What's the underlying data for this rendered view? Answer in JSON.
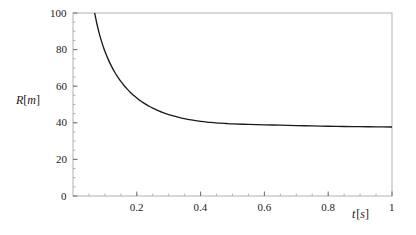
{
  "chart_data": {
    "type": "line",
    "title": "",
    "subtitle": "",
    "xlabel": "t [s]",
    "ylabel": "R[m]",
    "xlabel_parts": {
      "symbol": "t",
      "open": "[",
      "unit": "s",
      "close": "]"
    },
    "ylabel_parts": {
      "symbol": "R",
      "open": "[",
      "unit": "m",
      "close": "]"
    },
    "xlim": [
      0,
      1
    ],
    "ylim": [
      0,
      100
    ],
    "xticks": [
      0.2,
      0.4,
      0.6,
      0.8,
      1
    ],
    "xtick_labels": [
      "0.2",
      "0.4",
      "0.6",
      "0.8",
      "1"
    ],
    "yticks": [
      0,
      20,
      40,
      60,
      80,
      100
    ],
    "ytick_labels": [
      "0",
      "20",
      "40",
      "60",
      "80",
      "100"
    ],
    "x_minor_step": 0.05,
    "y_minor_step": 5,
    "grid": false,
    "legend": null,
    "legend_position": "none",
    "frame": true,
    "series": [
      {
        "name": "R(t)",
        "color": "#1a1a1a",
        "x": [
          0.068,
          0.072,
          0.076,
          0.08,
          0.085,
          0.09,
          0.095,
          0.1,
          0.11,
          0.12,
          0.13,
          0.14,
          0.15,
          0.16,
          0.17,
          0.18,
          0.19,
          0.2,
          0.21,
          0.22,
          0.23,
          0.24,
          0.25,
          0.26,
          0.27,
          0.28,
          0.3,
          0.32,
          0.34,
          0.36,
          0.38,
          0.4,
          0.42,
          0.44,
          0.46,
          0.48,
          0.5,
          0.55,
          0.6,
          0.65,
          0.7,
          0.75,
          0.8,
          0.85,
          0.9,
          0.95,
          1.0
        ],
        "y": [
          100.0,
          96.5,
          93.3,
          90.4,
          87.1,
          84.2,
          81.5,
          79.1,
          74.8,
          71.1,
          67.9,
          65.1,
          62.6,
          60.4,
          58.4,
          56.6,
          55.0,
          53.5,
          52.2,
          51.0,
          49.9,
          48.9,
          48.0,
          47.2,
          46.4,
          45.7,
          44.5,
          43.5,
          42.6,
          41.9,
          41.3,
          40.8,
          40.4,
          40.1,
          39.8,
          39.6,
          39.4,
          39.1,
          38.9,
          38.7,
          38.5,
          38.3,
          38.1,
          38.0,
          37.9,
          37.8,
          37.7
        ]
      }
    ],
    "annotations": [
      {
        "text": "curve enters plot at top frame R = 100 near t = 0.068"
      },
      {
        "text": "curve approaches horizontal asymptote near R = 37.7 m"
      }
    ]
  },
  "frame_color": "#b8b8b8",
  "curve_color": "#1a1a1a",
  "tick_color": "#8a8a8a",
  "background": "#ffffff"
}
